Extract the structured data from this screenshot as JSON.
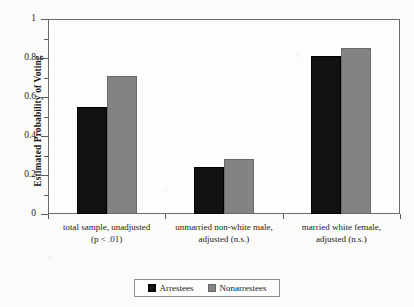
{
  "chart_data": {
    "type": "bar",
    "title": "",
    "xlabel": "",
    "ylabel": "Estimated Probability of Voting",
    "ylim": [
      0,
      1
    ],
    "yticks": [
      "0",
      "0.2",
      "0.4",
      "0.6",
      "0.8",
      "1"
    ],
    "grid": false,
    "legend_position": "bottom",
    "categories": [
      "total sample, unadjusted (p < .01)",
      "unmarried non-white male, adjusted (n.s.)",
      "married white female, adjusted (n.s.)"
    ],
    "category_lines": [
      {
        "line1": "total sample, unadjusted",
        "line2": "(p < .01)"
      },
      {
        "line1": "unmarried non-white male,",
        "line2": "adjusted (n.s.)"
      },
      {
        "line1": "married white female,",
        "line2": "adjusted (n.s.)"
      }
    ],
    "series": [
      {
        "name": "Arrestees",
        "color": "#111111",
        "values": [
          0.55,
          0.24,
          0.81
        ]
      },
      {
        "name": "Nonarrestees",
        "color": "#838383",
        "values": [
          0.71,
          0.28,
          0.85
        ]
      }
    ]
  },
  "legend": {
    "entries": [
      {
        "label": "Arrestees",
        "swatch": "black-square-swatch"
      },
      {
        "label": "Nonarrestees",
        "swatch": "gray-square-swatch"
      }
    ]
  }
}
